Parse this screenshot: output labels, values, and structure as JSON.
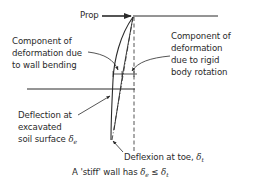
{
  "diagram": {
    "type": "retaining-wall-deflection",
    "labels": {
      "prop": "Prop",
      "bending_line1": "Component of",
      "bending_line2": "deformation due",
      "bending_line3": "to wall bending",
      "rigid_line1": "Component of",
      "rigid_line2": "deformation",
      "rigid_line3": "due to rigid",
      "rigid_line4": "body rotation",
      "excavated_line1": "Deflection at",
      "excavated_line2": "excavated",
      "excavated_line3": "soil surface",
      "delta": "δ",
      "sub_e": "e",
      "sub_t": "t",
      "toe_prefix": "Deflexion at toe, ",
      "caption_prefix": "A 'stiff' wall has ",
      "leq": " ≤ "
    },
    "colors": {
      "ink": "#2a2a2a",
      "background": "#ffffff"
    }
  }
}
